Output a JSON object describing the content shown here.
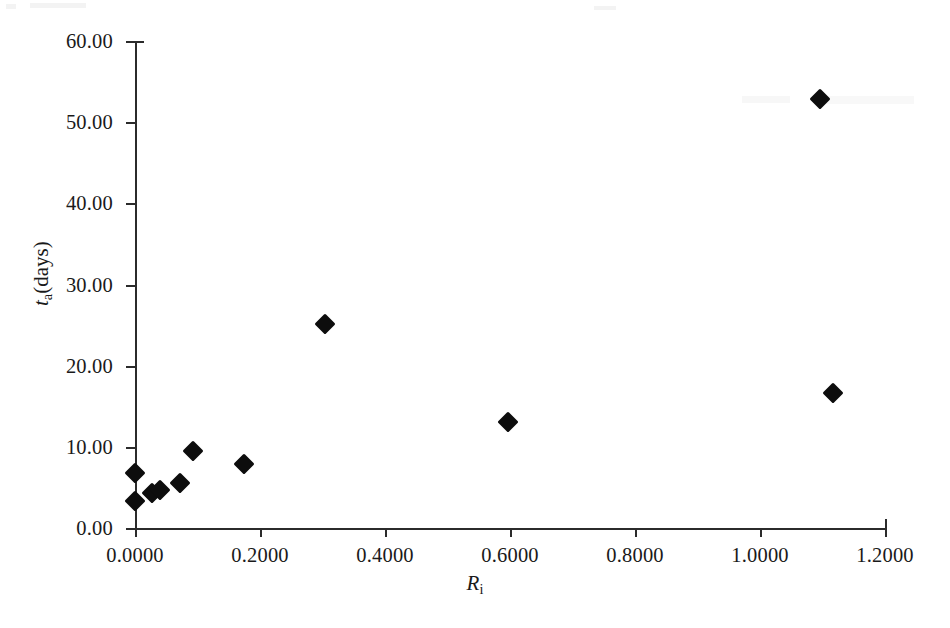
{
  "chart_data": {
    "type": "scatter",
    "title": "",
    "xlabel": "R_i",
    "ylabel": "t_a(days)",
    "xlim": [
      0.0,
      1.2
    ],
    "ylim": [
      0.0,
      60.0
    ],
    "grid": false,
    "legend": null,
    "x_tick_labels": [
      "0.0000",
      "0.2000",
      "0.4000",
      "0.6000",
      "0.8000",
      "1.0000",
      "1.2000"
    ],
    "x_tick_values": [
      0.0,
      0.2,
      0.4,
      0.6,
      0.8,
      1.0,
      1.2
    ],
    "y_tick_labels": [
      "0.00",
      "10.00",
      "20.00",
      "30.00",
      "40.00",
      "50.00",
      "60.00"
    ],
    "y_tick_values": [
      0,
      10,
      20,
      30,
      40,
      50,
      60
    ],
    "series": [
      {
        "name": "data",
        "marker": "diamond",
        "color": "#0d0d0d",
        "points": [
          {
            "x": 0.0,
            "y": 6.8
          },
          {
            "x": 0.0,
            "y": 3.3
          },
          {
            "x": 0.027,
            "y": 4.3
          },
          {
            "x": 0.04,
            "y": 4.7
          },
          {
            "x": 0.072,
            "y": 5.6
          },
          {
            "x": 0.093,
            "y": 9.5
          },
          {
            "x": 0.174,
            "y": 7.9
          },
          {
            "x": 0.304,
            "y": 25.1
          },
          {
            "x": 0.597,
            "y": 13.1
          },
          {
            "x": 1.096,
            "y": 52.9
          },
          {
            "x": 1.117,
            "y": 16.6
          }
        ]
      }
    ]
  },
  "axes": {
    "x_title_symbol": "R",
    "x_title_subscript": "i",
    "y_title_symbol": "t",
    "y_title_subscript": "a",
    "y_title_suffix": "(days)"
  }
}
